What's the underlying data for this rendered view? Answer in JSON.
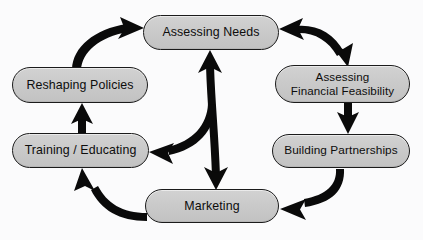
{
  "diagram": {
    "type": "cycle-flow-diagram",
    "background_color": "#fbfbfc",
    "node_fill_color": "#cacaca",
    "node_border_color": "#1b1b1b",
    "arrow_color": "#0a0a0a",
    "nodes": [
      {
        "id": "assessing-needs",
        "label": "Assessing Needs"
      },
      {
        "id": "assessing-financial",
        "label": "Assessing\nFinancial Feasibility"
      },
      {
        "id": "building-partnerships",
        "label": "Building Partnerships"
      },
      {
        "id": "marketing",
        "label": "Marketing"
      },
      {
        "id": "training-educating",
        "label": "Training / Educating"
      },
      {
        "id": "reshaping-policies",
        "label": "Reshaping Policies"
      }
    ],
    "connections": [
      {
        "id": "reshaping-to-assessing",
        "from": "reshaping-policies",
        "to": "assessing-needs",
        "style": "curved",
        "heads": "single"
      },
      {
        "id": "assessing-to-financial",
        "from": "assessing-needs",
        "to": "assessing-financial",
        "style": "curved",
        "heads": "double"
      },
      {
        "id": "financial-to-building",
        "from": "assessing-financial",
        "to": "building-partnerships",
        "style": "straight",
        "heads": "single"
      },
      {
        "id": "building-to-marketing",
        "from": "building-partnerships",
        "to": "marketing",
        "style": "curved",
        "heads": "single"
      },
      {
        "id": "marketing-to-training",
        "from": "marketing",
        "to": "training-educating",
        "style": "curved",
        "heads": "single"
      },
      {
        "id": "training-to-reshaping",
        "from": "training-educating",
        "to": "reshaping-policies",
        "style": "straight",
        "heads": "single"
      },
      {
        "id": "needs-marketing-vertical",
        "from": "assessing-needs",
        "to": "marketing",
        "style": "straight",
        "heads": "double"
      },
      {
        "id": "center-to-training",
        "from": "needs-marketing-vertical",
        "to": "training-educating",
        "style": "curved",
        "heads": "single"
      }
    ]
  }
}
